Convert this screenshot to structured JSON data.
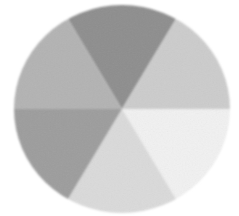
{
  "figure": {
    "background_color": "#ffffff",
    "width": 239,
    "height": 216
  },
  "disc": {
    "center_x": 122,
    "center_y": 109,
    "radius_x": 108,
    "radius_y": 104,
    "sector_count": 6,
    "sector_angle_degrees": 60,
    "edge_softness": "soft-antialiased",
    "texture": "fine-woven-noise"
  },
  "chart_data": {
    "type": "pie",
    "xlabel": "",
    "ylabel": "",
    "grid": false,
    "legend_position": "none",
    "categories": [
      "top",
      "upper-right",
      "lower-right",
      "bottom",
      "lower-left",
      "upper-left"
    ],
    "values": [
      16.6667,
      16.6667,
      16.6667,
      16.6667,
      16.6667,
      16.6667
    ],
    "slices": [
      {
        "name": "top",
        "label": "Top sector",
        "value": 16.6667,
        "start_angle": -120,
        "end_angle": -60,
        "color": "#8e8e8e",
        "gray_level": 142
      },
      {
        "name": "upper-right",
        "label": "Upper-right sector",
        "value": 16.6667,
        "start_angle": -60,
        "end_angle": 0,
        "color": "#cccccc",
        "gray_level": 204
      },
      {
        "name": "lower-right",
        "label": "Lower-right sector",
        "value": 16.6667,
        "start_angle": 0,
        "end_angle": 60,
        "color": "#f1f1f1",
        "gray_level": 241
      },
      {
        "name": "bottom",
        "label": "Bottom sector",
        "value": 16.6667,
        "start_angle": 60,
        "end_angle": 120,
        "color": "#dadada",
        "gray_level": 218
      },
      {
        "name": "lower-left",
        "label": "Lower-left sector",
        "value": 16.6667,
        "start_angle": 120,
        "end_angle": 180,
        "color": "#9d9d9d",
        "gray_level": 157
      },
      {
        "name": "upper-left",
        "label": "Upper-left sector",
        "value": 16.6667,
        "start_angle": 180,
        "end_angle": 240,
        "color": "#b3b3b3",
        "gray_level": 179
      }
    ]
  }
}
